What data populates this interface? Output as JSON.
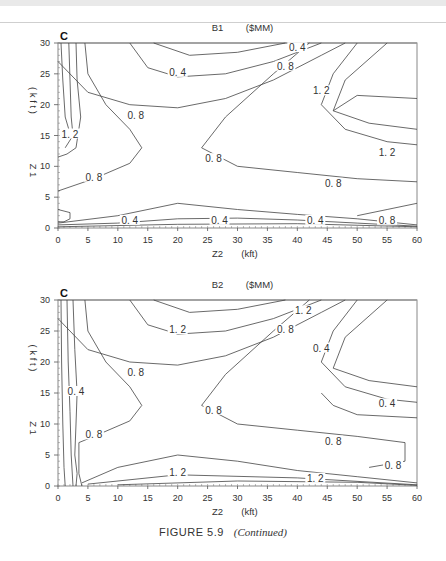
{
  "figure_caption": {
    "label": "FIGURE 5.9",
    "note": "(Continued)"
  },
  "chart_data": [
    {
      "type": "contour",
      "panel_letter": "C",
      "title": "B1",
      "units": "($MM)",
      "xlabel": "Z2",
      "xunits": "(kft)",
      "ylabel": "Z1",
      "yunits": "(kft)",
      "xlim": [
        0,
        60
      ],
      "ylim": [
        0,
        30
      ],
      "xticks": [
        0,
        5,
        10,
        15,
        20,
        25,
        30,
        35,
        40,
        45,
        50,
        55,
        60
      ],
      "yticks": [
        0,
        5,
        10,
        15,
        20,
        25,
        30
      ],
      "contour_levels": [
        0.4,
        0.8,
        1.2
      ],
      "contour_labels": [
        {
          "text": "1.2",
          "x": 2,
          "y": 15
        },
        {
          "text": "0.8",
          "x": 13,
          "y": 18
        },
        {
          "text": "0.8",
          "x": 6,
          "y": 8
        },
        {
          "text": "0.4",
          "x": 20,
          "y": 25
        },
        {
          "text": "0.8",
          "x": 38,
          "y": 26
        },
        {
          "text": "0.4",
          "x": 40,
          "y": 29
        },
        {
          "text": "1.2",
          "x": 44,
          "y": 22
        },
        {
          "text": "0.8",
          "x": 26,
          "y": 11
        },
        {
          "text": "1.2",
          "x": 55,
          "y": 12
        },
        {
          "text": "0.8",
          "x": 46,
          "y": 7
        },
        {
          "text": "0.4",
          "x": 12,
          "y": 1
        },
        {
          "text": "0.4",
          "x": 27,
          "y": 1
        },
        {
          "text": "0.4",
          "x": 43,
          "y": 1
        },
        {
          "text": "0.8",
          "x": 55,
          "y": 1
        }
      ]
    },
    {
      "type": "contour",
      "panel_letter": "C",
      "title": "B2",
      "units": "($MM)",
      "xlabel": "Z2",
      "xunits": "(kft)",
      "ylabel": "Z1",
      "yunits": "(kft)",
      "xlim": [
        0,
        60
      ],
      "ylim": [
        0,
        30
      ],
      "xticks": [
        0,
        5,
        10,
        15,
        20,
        25,
        30,
        35,
        40,
        45,
        50,
        55,
        60
      ],
      "yticks": [
        0,
        5,
        10,
        15,
        20,
        25,
        30
      ],
      "contour_levels": [
        0.4,
        0.8,
        1.2
      ],
      "contour_labels": [
        {
          "text": "0.4",
          "x": 3,
          "y": 15
        },
        {
          "text": "0.8",
          "x": 13,
          "y": 18
        },
        {
          "text": "0.8",
          "x": 6,
          "y": 8
        },
        {
          "text": "1.2",
          "x": 20,
          "y": 25
        },
        {
          "text": "0.8",
          "x": 38,
          "y": 25
        },
        {
          "text": "1.2",
          "x": 41,
          "y": 28
        },
        {
          "text": "0.4",
          "x": 44,
          "y": 22
        },
        {
          "text": "0.8",
          "x": 26,
          "y": 12
        },
        {
          "text": "0.4",
          "x": 55,
          "y": 13
        },
        {
          "text": "0.8",
          "x": 46,
          "y": 7
        },
        {
          "text": "0.8",
          "x": 56,
          "y": 3
        },
        {
          "text": "1.2",
          "x": 20,
          "y": 2
        },
        {
          "text": "1.2",
          "x": 43,
          "y": 1
        }
      ]
    }
  ]
}
